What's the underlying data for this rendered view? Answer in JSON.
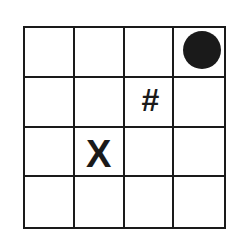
{
  "grid": {
    "rows": 4,
    "cols": 4,
    "line_color": "#1a1a1a",
    "cells": [
      [
        "",
        "",
        "",
        "●"
      ],
      [
        "",
        "",
        "#",
        ""
      ],
      [
        "",
        "X",
        "",
        ""
      ],
      [
        "",
        "",
        "",
        ""
      ]
    ]
  },
  "symbols": {
    "dot": {
      "row": 0,
      "col": 3,
      "type": "filled-circle"
    },
    "hash": {
      "row": 1,
      "col": 2,
      "text": "#"
    },
    "x": {
      "row": 2,
      "col": 1,
      "text": "X"
    }
  }
}
